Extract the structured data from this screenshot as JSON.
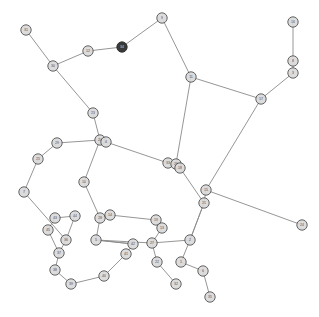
{
  "figure": {
    "title": "",
    "background_color": "#ffffff",
    "width": 319,
    "height": 317
  },
  "style": {
    "node_fill": "#d9d9d9",
    "node_stroke": "#4a4a4a",
    "node_radius": 5.2,
    "highlight_fill": "#3a3a3a",
    "edge_color": "#8a8a8a",
    "edge_width": 0.9
  },
  "chart_data": {
    "type": "scatter",
    "title": "",
    "xlabel": "",
    "ylabel": "",
    "grid": false,
    "legend": "none",
    "xlim": [
      0,
      319
    ],
    "ylim": [
      0,
      317
    ],
    "graph": {
      "layout": "force-directed",
      "directed": false,
      "node_count": 45,
      "edge_count": 50,
      "highlighted_nodes": [
        "n6"
      ]
    },
    "nodes": [
      {
        "id": "n0",
        "label": "31",
        "x": 26,
        "y": 30,
        "highlight": false
      },
      {
        "id": "n1",
        "label": "30",
        "x": 53,
        "y": 66,
        "highlight": false
      },
      {
        "id": "n2",
        "label": "12",
        "x": 88,
        "y": 51,
        "highlight": false
      },
      {
        "id": "n6",
        "label": "34",
        "x": 122,
        "y": 47,
        "highlight": true
      },
      {
        "id": "n3",
        "label": "9",
        "x": 162,
        "y": 18,
        "highlight": false
      },
      {
        "id": "n4",
        "label": "11",
        "x": 191,
        "y": 77,
        "highlight": false
      },
      {
        "id": "n5",
        "label": "17",
        "x": 261,
        "y": 99,
        "highlight": false
      },
      {
        "id": "n7",
        "label": "16",
        "x": 293,
        "y": 22,
        "highlight": false
      },
      {
        "id": "n8",
        "label": "8",
        "x": 293,
        "y": 61,
        "highlight": false
      },
      {
        "id": "n9",
        "label": "3",
        "x": 293,
        "y": 73,
        "highlight": false
      },
      {
        "id": "n10",
        "label": "23",
        "x": 93,
        "y": 113,
        "highlight": false
      },
      {
        "id": "n11",
        "label": "20",
        "x": 100,
        "y": 140,
        "highlight": false
      },
      {
        "id": "n12",
        "label": "4",
        "x": 106,
        "y": 142,
        "highlight": false
      },
      {
        "id": "n13",
        "label": "29",
        "x": 57,
        "y": 143,
        "highlight": false
      },
      {
        "id": "n14",
        "label": "25",
        "x": 38,
        "y": 159,
        "highlight": false
      },
      {
        "id": "n15",
        "label": "7",
        "x": 24,
        "y": 192,
        "highlight": false
      },
      {
        "id": "n16",
        "label": "10",
        "x": 84,
        "y": 182,
        "highlight": false
      },
      {
        "id": "n17",
        "label": "33",
        "x": 168,
        "y": 163,
        "highlight": false
      },
      {
        "id": "n18",
        "label": "26",
        "x": 176,
        "y": 164,
        "highlight": false
      },
      {
        "id": "n19",
        "label": "18",
        "x": 180,
        "y": 168,
        "highlight": false
      },
      {
        "id": "n20",
        "label": "21",
        "x": 204,
        "y": 203,
        "highlight": false
      },
      {
        "id": "n21",
        "label": "15",
        "x": 206,
        "y": 190,
        "highlight": false
      },
      {
        "id": "n22",
        "label": "24",
        "x": 302,
        "y": 225,
        "highlight": false
      },
      {
        "id": "n23",
        "label": "28",
        "x": 100,
        "y": 218,
        "highlight": false
      },
      {
        "id": "n24",
        "label": "14",
        "x": 110,
        "y": 215,
        "highlight": false
      },
      {
        "id": "n25",
        "label": "5",
        "x": 96,
        "y": 240,
        "highlight": false
      },
      {
        "id": "n26",
        "label": "19",
        "x": 156,
        "y": 220,
        "highlight": false
      },
      {
        "id": "n27",
        "label": "13",
        "x": 162,
        "y": 228,
        "highlight": false
      },
      {
        "id": "n28",
        "label": "27",
        "x": 152,
        "y": 243,
        "highlight": false
      },
      {
        "id": "n29",
        "label": "2",
        "x": 190,
        "y": 240,
        "highlight": false
      },
      {
        "id": "n30",
        "label": "22",
        "x": 157,
        "y": 262,
        "highlight": false
      },
      {
        "id": "n31",
        "label": "1",
        "x": 181,
        "y": 262,
        "highlight": false
      },
      {
        "id": "n32",
        "label": "32",
        "x": 176,
        "y": 284,
        "highlight": false
      },
      {
        "id": "n33",
        "label": "6",
        "x": 203,
        "y": 271,
        "highlight": false
      },
      {
        "id": "n34",
        "label": "35",
        "x": 210,
        "y": 297,
        "highlight": false
      },
      {
        "id": "n35",
        "label": "36",
        "x": 66,
        "y": 240,
        "highlight": false
      },
      {
        "id": "n36",
        "label": "37",
        "x": 59,
        "y": 253,
        "highlight": false
      },
      {
        "id": "n37",
        "label": "38",
        "x": 55,
        "y": 270,
        "highlight": false
      },
      {
        "id": "n38",
        "label": "39",
        "x": 71,
        "y": 284,
        "highlight": false
      },
      {
        "id": "n39",
        "label": "40",
        "x": 104,
        "y": 276,
        "highlight": false
      },
      {
        "id": "n40",
        "label": "41",
        "x": 126,
        "y": 254,
        "highlight": false
      },
      {
        "id": "n41",
        "label": "42",
        "x": 133,
        "y": 244,
        "highlight": false
      },
      {
        "id": "n42",
        "label": "43",
        "x": 55,
        "y": 218,
        "highlight": false
      },
      {
        "id": "n43",
        "label": "44",
        "x": 75,
        "y": 216,
        "highlight": false
      },
      {
        "id": "n44",
        "label": "45",
        "x": 48,
        "y": 230,
        "highlight": false
      }
    ],
    "edges": [
      [
        "n0",
        "n1"
      ],
      [
        "n1",
        "n2"
      ],
      [
        "n2",
        "n6"
      ],
      [
        "n6",
        "n3"
      ],
      [
        "n3",
        "n4"
      ],
      [
        "n4",
        "n5"
      ],
      [
        "n4",
        "n18"
      ],
      [
        "n5",
        "n9"
      ],
      [
        "n5",
        "n21"
      ],
      [
        "n8",
        "n7"
      ],
      [
        "n8",
        "n9"
      ],
      [
        "n1",
        "n10"
      ],
      [
        "n10",
        "n11"
      ],
      [
        "n11",
        "n12"
      ],
      [
        "n11",
        "n13"
      ],
      [
        "n12",
        "n17"
      ],
      [
        "n11",
        "n16"
      ],
      [
        "n13",
        "n14"
      ],
      [
        "n14",
        "n15"
      ],
      [
        "n15",
        "n35"
      ],
      [
        "n16",
        "n23"
      ],
      [
        "n17",
        "n18"
      ],
      [
        "n18",
        "n19"
      ],
      [
        "n19",
        "n20"
      ],
      [
        "n20",
        "n21"
      ],
      [
        "n21",
        "n22"
      ],
      [
        "n20",
        "n29"
      ],
      [
        "n23",
        "n24"
      ],
      [
        "n23",
        "n25"
      ],
      [
        "n24",
        "n26"
      ],
      [
        "n25",
        "n28"
      ],
      [
        "n26",
        "n27"
      ],
      [
        "n27",
        "n28"
      ],
      [
        "n28",
        "n29"
      ],
      [
        "n29",
        "n20"
      ],
      [
        "n28",
        "n30"
      ],
      [
        "n29",
        "n31"
      ],
      [
        "n30",
        "n32"
      ],
      [
        "n31",
        "n33"
      ],
      [
        "n33",
        "n34"
      ],
      [
        "n25",
        "n41"
      ],
      [
        "n35",
        "n36"
      ],
      [
        "n36",
        "n37"
      ],
      [
        "n37",
        "n38"
      ],
      [
        "n38",
        "n39"
      ],
      [
        "n39",
        "n40"
      ],
      [
        "n40",
        "n41"
      ],
      [
        "n41",
        "n25"
      ],
      [
        "n42",
        "n43"
      ],
      [
        "n42",
        "n44"
      ],
      [
        "n44",
        "n36"
      ],
      [
        "n43",
        "n35"
      ]
    ]
  }
}
